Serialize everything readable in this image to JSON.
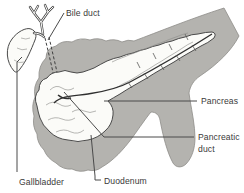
{
  "figure": {
    "labels": {
      "bile_duct": "Bile duct",
      "pancreas": "Pancreas",
      "pancreatic_duct_line1": "Pancreatic",
      "pancreatic_duct_line2": "duct",
      "gallbladder": "Gallbladder",
      "duodenum": "Duodenum"
    },
    "colors": {
      "background": "#ffffff",
      "shade_gray": "#b4b3af",
      "outline": "#4a4a4a",
      "label_text": "#3a3a3a"
    }
  }
}
